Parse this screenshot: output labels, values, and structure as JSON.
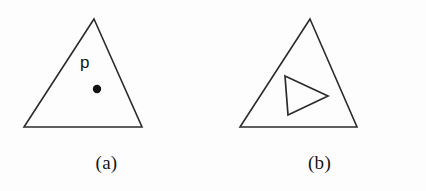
{
  "figure": {
    "width": 426,
    "height": 191,
    "background_color": "#fdfdfd",
    "stroke_color": "#2b2b2b",
    "dot_color": "#111111",
    "panels": [
      {
        "id": "a",
        "caption": "(a)",
        "outer_shape": {
          "name": "triangle",
          "points": "94,19 142,127 24,127"
        },
        "point_label": "p",
        "point_label_position": {
          "x": 80,
          "y": 54
        },
        "marker_dot": {
          "cx": 97,
          "cy": 89,
          "r": 4.2
        },
        "inner_shape": null
      },
      {
        "id": "b",
        "caption": "(b)",
        "outer_shape": {
          "name": "triangle",
          "points": "97,19 144,127 27,127"
        },
        "point_label": null,
        "point_label_position": null,
        "marker_dot": null,
        "inner_shape": {
          "name": "triangle",
          "points": "72,76 115,96 75,115"
        }
      }
    ]
  }
}
